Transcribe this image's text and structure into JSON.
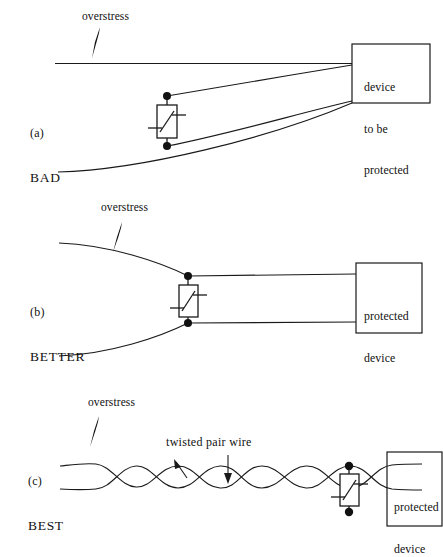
{
  "figure": {
    "type": "technical-diagram",
    "background_color": "#ffffff",
    "line_color": "#1a1a1a"
  },
  "panels": [
    {
      "id": "a",
      "index_label": "(a)",
      "quality_label": "BAD",
      "overstress_label": "overstress",
      "device_box_lines": [
        "device",
        "to be",
        "protected"
      ],
      "component": "varistor",
      "wiring": "long separated loop area, large enclosed loop between protector and device"
    },
    {
      "id": "b",
      "index_label": "(b)",
      "quality_label": "BETTER",
      "overstress_label": "overstress",
      "device_box_lines": [
        "protected",
        "device"
      ],
      "component": "varistor",
      "wiring": "wires converge at protector then run closely parallel to device"
    },
    {
      "id": "c",
      "index_label": "(c)",
      "quality_label": "BEST",
      "overstress_label": "overstress",
      "device_box_lines": [
        "protected",
        "device"
      ],
      "component": "varistor",
      "annotation_label": "twisted pair wire",
      "wiring": "twisted pair wire throughout with protector at the device end"
    }
  ],
  "icons": {
    "overstress_bolt": "lightning-bolt-icon",
    "varistor": "varistor-symbol-icon",
    "terminal_dot": "terminal-dot-icon",
    "annotation_arrow": "arrow-icon"
  }
}
